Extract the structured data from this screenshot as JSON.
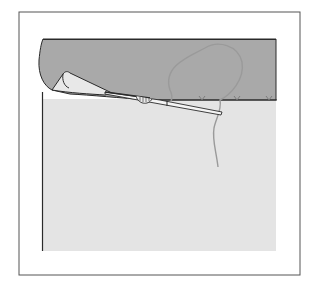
{
  "diagram": {
    "colors": {
      "background": "#ffffff",
      "frame": "#555555",
      "hem_fabric": "#a9a9a9",
      "garment_fabric": "#e4e4e4",
      "thread": "#9a9a9a",
      "outline": "#2a2a2a",
      "needle": "#f4f4f4"
    },
    "elements": {
      "stitch_count_visible": 3
    }
  }
}
